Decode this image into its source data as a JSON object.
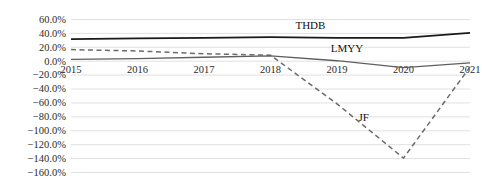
{
  "chart_data": {
    "type": "line",
    "title": "",
    "subtitle": "",
    "xlabel": "",
    "ylabel": "",
    "categories": [
      "2015",
      "2016",
      "2017",
      "2018",
      "2019",
      "2020",
      "2021"
    ],
    "x": [
      2015,
      2016,
      2017,
      2018,
      2019,
      2020,
      2021
    ],
    "ylim": [
      -160,
      60
    ],
    "ytick_values": [
      60,
      40,
      20,
      0,
      -20,
      -40,
      -60,
      -80,
      -100,
      -120,
      -140,
      -160
    ],
    "ytick_labels": [
      "60.0%",
      "40.0%",
      "20.0%",
      "0.0%",
      "-20.0%",
      "-40.0%",
      "-60.0%",
      "-80.0%",
      "-100.0%",
      "-120.0%",
      "-140.0%",
      "-160.0%"
    ],
    "ytick_step": 20,
    "grid": true,
    "grid_axis": "y",
    "legend": "inline-series-labels",
    "legend_position": "inline",
    "series": [
      {
        "name": "THDB",
        "label": "THDB",
        "values": [
          31,
          32,
          33,
          34,
          33,
          33,
          40
        ],
        "color": "#1a1a1a",
        "style": "solid",
        "width": 1.8,
        "label_x": 2018.6,
        "label_y": 45
      },
      {
        "name": "JF",
        "label": "JF",
        "values": [
          16,
          14,
          10,
          8,
          -62,
          -140,
          -9
        ],
        "color": "#6b6b6b",
        "style": "dashed",
        "width": 1.5,
        "label_x": 2019.4,
        "label_y": -86
      },
      {
        "name": "LMYY",
        "label": "LMYY",
        "values": [
          2,
          3,
          5,
          7,
          0,
          -10,
          -3
        ],
        "color": "#5f5f5f",
        "style": "solid",
        "width": 1.3,
        "label_x": 2019.15,
        "label_y": 12
      }
    ]
  },
  "axes": {
    "y_tick_0": "60.0%",
    "y_tick_1": "40.0%",
    "y_tick_2": "20.0%",
    "y_tick_3": "0.0%",
    "y_tick_4": "-20.0%",
    "y_tick_5": "-40.0%",
    "y_tick_6": "-60.0%",
    "y_tick_7": "-80.0%",
    "y_tick_8": "-100.0%",
    "y_tick_9": "-120.0%",
    "y_tick_10": "-140.0%",
    "y_tick_11": "-160.0%",
    "x_tick_0": "2015",
    "x_tick_1": "2016",
    "x_tick_2": "2017",
    "x_tick_3": "2018",
    "x_tick_4": "2019",
    "x_tick_5": "2020",
    "x_tick_6": "2021"
  },
  "series_labels": {
    "thdb": "THDB",
    "jf": "JF",
    "lmyy": "LMYY"
  }
}
